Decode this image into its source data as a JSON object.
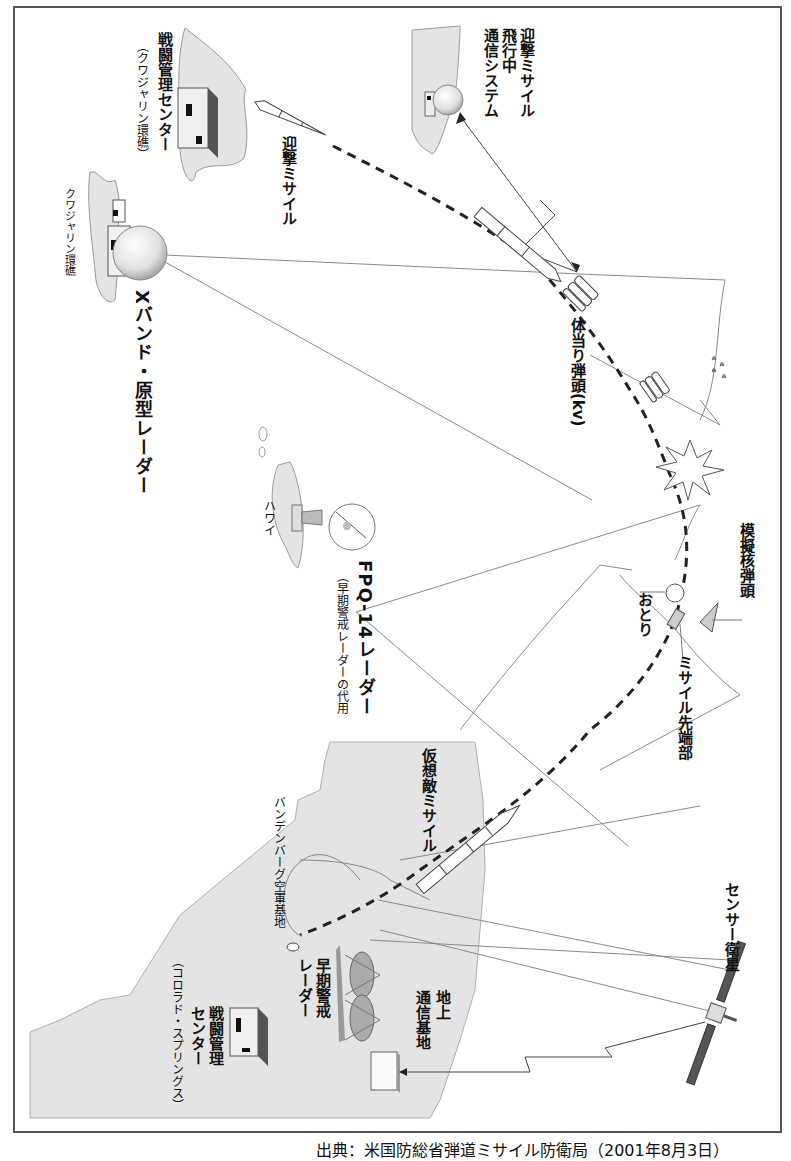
{
  "orientation": "rotated-90-clockwise",
  "labels": {
    "interceptor_comm": [
      "迎撃ミサイル",
      "飛行中",
      "通信システム"
    ],
    "bmc_kwajalein": "戦闘管理センター",
    "bmc_kwajalein_sub": "（クワジャリン環礁）",
    "interceptor_missile": "迎撃ミサイル",
    "kwajalein_atoll": "クワジャリン環礁",
    "xband_radar": "Xバンド・原型レーダー",
    "kill_vehicle": "体当り弾頭(kv)",
    "hawaii": "ハワイ",
    "fpq14_radar": "FPQ-14レーダー",
    "fpq14_radar_sub": "（早期警戒レーダーの代用",
    "mock_warhead": "模擬核弾頭",
    "decoy": "おとり",
    "missile_nose": "ミサイル先端部",
    "target_missile": "仮想敵ミサイル",
    "vandenberg": "バンデンバーグ空軍基地",
    "early_warning_radar": [
      "早期警戒",
      "レーダー"
    ],
    "ground_comm": [
      "地上",
      "通信基地"
    ],
    "bmc_colorado": [
      "戦闘管理",
      "センター"
    ],
    "bmc_colorado_sub": "（コロラド・スプリングス）",
    "sensor_satellite": "センサー衛星"
  },
  "icons": [
    "building-icon",
    "interceptor-missile-icon",
    "radar-dome-icon",
    "kill-vehicle-icon",
    "explosion-icon",
    "dish-antenna-icon",
    "decoy-balloon-icon",
    "warhead-icon",
    "target-missile-icon",
    "phased-array-radar-icon",
    "satellite-icon",
    "ground-station-icon"
  ],
  "colors": {
    "land": "#e4e4e4",
    "land_stroke": "#9a9a9a",
    "line": "#8a8a8a",
    "dark": "#333333",
    "panel": "#555555"
  },
  "caption": "出典：米国防総省弾道ミサイル防衛局（2001年8月3日）"
}
